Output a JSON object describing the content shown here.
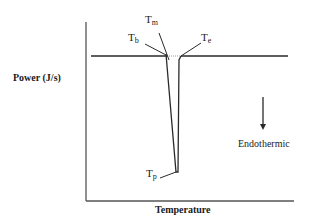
{
  "diagram": {
    "type": "DSC thermogram (schematic)",
    "y_axis_label": "Power (J/s)",
    "x_axis_label": "Temperature",
    "annotation": "Endothermic",
    "annotation_arrow": "down-arrow",
    "points": [
      {
        "symbol": "T",
        "sub": "b"
      },
      {
        "symbol": "T",
        "sub": "m"
      },
      {
        "symbol": "T",
        "sub": "e"
      },
      {
        "symbol": "T",
        "sub": "p"
      }
    ],
    "colors": {
      "line": "#2a2a2a",
      "axis": "#555555",
      "background": "#ffffff"
    }
  }
}
